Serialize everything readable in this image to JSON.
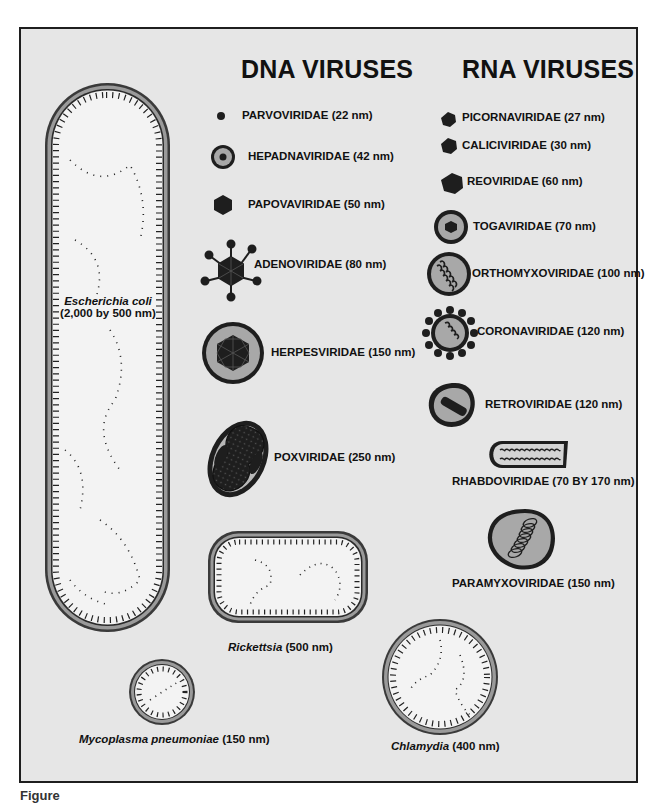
{
  "headers": {
    "dna": "DNA VIRUSES",
    "rna": "RNA VIRUSES"
  },
  "dna_viruses": [
    {
      "name": "PARVOVIRIDAE (22 nm)",
      "icon": "small-dot-virion"
    },
    {
      "name": "HEPADNAVIRIDAE (42 nm)",
      "icon": "enveloped-core-virion"
    },
    {
      "name": "PAPOVAVIRIDAE (50 nm)",
      "icon": "hexagonal-capsid"
    },
    {
      "name": "ADENOVIRIDAE (80 nm)",
      "icon": "icosahedral-with-fibers"
    },
    {
      "name": "HERPESVIRIDAE (150 nm)",
      "icon": "enveloped-icosahedral-capsid"
    },
    {
      "name": "POXVIRIDAE (250 nm)",
      "icon": "brick-dumbbell-core"
    }
  ],
  "rna_viruses": [
    {
      "name": "PICORNAVIRIDAE (27 nm)",
      "icon": "small-polyhedral-capsid"
    },
    {
      "name": "CALICIVIRIDAE (30 nm)",
      "icon": "small-polyhedral-capsid"
    },
    {
      "name": "REOVIRIDAE (60 nm)",
      "icon": "polyhedral-capsid"
    },
    {
      "name": "TOGAVIRIDAE (70 nm)",
      "icon": "enveloped-core-virion"
    },
    {
      "name": "ORTHOMYXOVIRIDAE (100 nm)",
      "icon": "enveloped-helical-nucleocapsid"
    },
    {
      "name": "CORONAVIRIDAE (120 nm)",
      "icon": "spiked-envelope-virion"
    },
    {
      "name": "RETROVIRIDAE (120 nm)",
      "icon": "enveloped-bar-core"
    },
    {
      "name": "RHABDOVIRIDAE (70 BY 170 nm)",
      "icon": "bullet-shaped-virion"
    },
    {
      "name": "PARAMYXOVIRIDAE (150 nm)",
      "icon": "enveloped-helical-coil"
    }
  ],
  "bacteria": {
    "ecoli": {
      "name": "Escherichia coli",
      "size": "(2,000 by 500 nm)"
    },
    "rickettsia": {
      "name": "Rickettsia",
      "size": " (500 nm)"
    },
    "mycoplasma": {
      "name": "Mycoplasma pneumoniae",
      "size": " (150 nm)"
    },
    "chlamydia": {
      "name": "Chlamydia",
      "size": " (400 nm)"
    }
  },
  "colors": {
    "frame_bg": "#e6e6e6",
    "outline": "#1e1e1e",
    "envelope_gray": "#9a9a9a",
    "cell_interior": "#f2f2f2"
  },
  "footer": {
    "figure_label": "Figure"
  }
}
